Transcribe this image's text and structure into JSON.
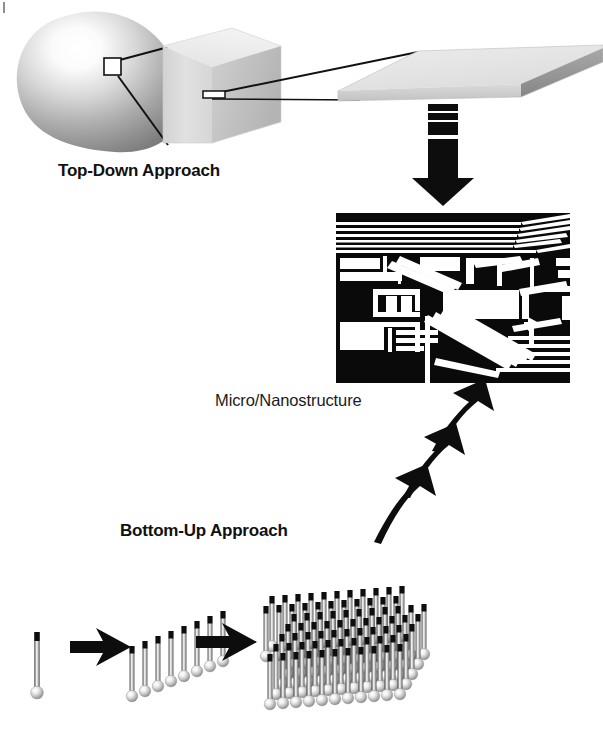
{
  "figure": {
    "background_color": "#ffffff",
    "width": 603,
    "height": 735
  },
  "labels": {
    "top_down": "Top-Down Approach",
    "bottom_up": "Bottom-Up Approach",
    "micro_nano": "Micro/Nanostructure"
  },
  "colors": {
    "ink": "#111111",
    "chip_black": "#0a0a0a",
    "chip_white": "#ffffff",
    "arrow_black": "#0d0d0d",
    "blob_light": "#fdfdfd",
    "blob_mid": "#b8b8b8",
    "blob_dark": "#6f6f6f",
    "cube_front": "#dcdcdc",
    "cube_top": "#ededed",
    "cube_side": "#c9c9c9",
    "slab_top": "#e6e6e6",
    "slab_edge": "#8a8a8a",
    "wire_shaft": "#c9c9c9",
    "wire_tip": "#101010",
    "bead_light": "#ffffff",
    "bead_mid": "#bdbdbd"
  },
  "top_down_row": {
    "items": [
      {
        "name": "bulk-material-blob",
        "kind": "organic-blob",
        "caption": ""
      },
      {
        "name": "magnified-cube",
        "kind": "cube",
        "caption": ""
      },
      {
        "name": "thin-film-slab",
        "kind": "wafer-slab",
        "caption": ""
      }
    ],
    "callout_boxes": [
      {
        "on": "bulk-material-blob",
        "shape": "square"
      },
      {
        "on": "magnified-cube",
        "shape": "thin-rectangle"
      }
    ],
    "leader_lines": 4
  },
  "bottom_up_row": {
    "stages": [
      {
        "name": "single-nanowire",
        "wire_count": 1,
        "rows": 1,
        "cols": 1
      },
      {
        "name": "nanowire-line",
        "wire_count": 8,
        "rows": 1,
        "cols": 8
      },
      {
        "name": "nanowire-array",
        "wire_count": 77,
        "rows": 7,
        "cols": 11
      }
    ],
    "arrows": [
      {
        "name": "stage-arrow-1",
        "direction": "right"
      },
      {
        "name": "stage-arrow-2",
        "direction": "right"
      }
    ]
  },
  "arrows": {
    "top_down_to_chip": {
      "name": "downward-arrow",
      "direction": "down",
      "band_count": 4,
      "label": ""
    },
    "bottom_up_to_chip": {
      "name": "curved-arrow-stack",
      "direction": "up-right",
      "count": 3
    }
  },
  "chip": {
    "name": "micro-nanostructure-chip",
    "x": 336,
    "y": 213,
    "width": 234,
    "height": 170,
    "description": "Integrated circuit layout pattern, black field with white interconnect traces"
  }
}
